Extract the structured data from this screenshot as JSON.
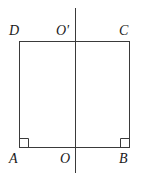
{
  "figure": {
    "background_color": "#ffffff",
    "stroke_color": "#3a3a3a",
    "stroke_width": 1,
    "labels": {
      "top_left": "D",
      "top_mid": "O'",
      "top_right": "C",
      "bottom_left": "A",
      "bottom_mid": "O",
      "bottom_right": "B"
    },
    "geometry": {
      "rect": {
        "x": 19,
        "y": 41,
        "width": 111,
        "height": 107
      },
      "axis_line": {
        "x": 75,
        "y1": 8,
        "y2": 173
      },
      "right_angle_marks": [
        {
          "at": "A",
          "x": 19,
          "y": 148,
          "size": 9
        },
        {
          "at": "B",
          "x": 130,
          "y": 148,
          "size": 9
        }
      ]
    }
  }
}
